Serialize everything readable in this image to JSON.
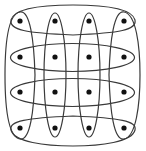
{
  "diagram": {
    "type": "hypergraph-grid",
    "grid": {
      "rows": 4,
      "cols": 4
    },
    "colors": {
      "edge": "#3a3a3a",
      "node": "#111111",
      "background": "#ffffff"
    },
    "columns_x": [
      20,
      55,
      89,
      124
    ],
    "rows_y": [
      21,
      57,
      92,
      128
    ],
    "node_radius": 2.6,
    "hyperedges": [
      {
        "id": "row-1",
        "kind": "row",
        "index": 1
      },
      {
        "id": "row-2",
        "kind": "row",
        "index": 2
      },
      {
        "id": "row-3",
        "kind": "row",
        "index": 3
      },
      {
        "id": "row-4",
        "kind": "row",
        "index": 4
      },
      {
        "id": "col-1",
        "kind": "column",
        "index": 1
      },
      {
        "id": "col-2",
        "kind": "column",
        "index": 2
      },
      {
        "id": "col-3",
        "kind": "column",
        "index": 3
      },
      {
        "id": "col-4",
        "kind": "column",
        "index": 4
      }
    ]
  }
}
